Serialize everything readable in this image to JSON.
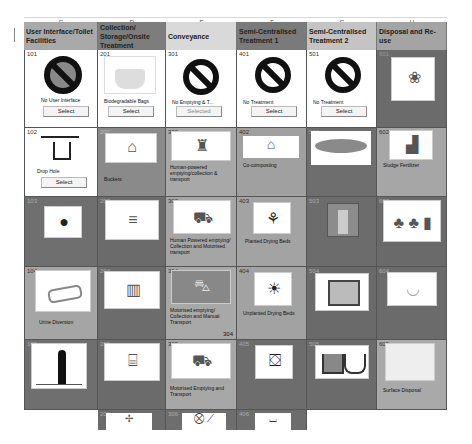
{
  "column_letters": [
    "C",
    "D",
    "E",
    "F",
    "G",
    "H"
  ],
  "headers": [
    {
      "label": "User Interface/Toilet Facilities",
      "color": "#a9a9a9"
    },
    {
      "label": "Collection/ Storage/Onsite Treatment",
      "color": "#7d7d7d"
    },
    {
      "label": "Conveyance",
      "color": "#d9d9d9"
    },
    {
      "label": "Semi-Centralised Treatment 1",
      "color": "#7a7a7a"
    },
    {
      "label": "Semi-Centralised Treatment 2",
      "color": "#c4c4c4"
    },
    {
      "label": "Disposal and Re-use",
      "color": "#a4a4a4"
    }
  ],
  "select_label": "Select",
  "selected_label": "Selected",
  "cells": {
    "c101": {
      "num": "101",
      "label": "No User Interface",
      "icon": "no-toilet-icon"
    },
    "c201": {
      "num": "201",
      "label": "Biodegradable Bags",
      "icon": "bag-icon"
    },
    "c301": {
      "num": "301",
      "label": "No Emptying & T...",
      "icon": "prohibited-icon"
    },
    "c401": {
      "num": "401",
      "label": "No Treatment",
      "icon": "prohibited-icon"
    },
    "c501": {
      "num": "501",
      "label": "No Treatment",
      "icon": "prohibited-icon"
    },
    "c601": {
      "num": "601",
      "label": "",
      "icon": "watering-can-icon"
    },
    "c102": {
      "num": "102",
      "label": "Drop Hole",
      "icon": "drop-hole-icon"
    },
    "c202": {
      "num": "202",
      "label": "Buckets",
      "icon": "bucket-icon"
    },
    "c302": {
      "num": "302",
      "label": "Human-powered emptying/collection & transport",
      "icon": "human-emptying-icon"
    },
    "c402": {
      "num": "402",
      "label": "Co-composting",
      "icon": "composting-icon"
    },
    "c502": {
      "num": "502",
      "label": "",
      "icon": "pond-icon"
    },
    "c602": {
      "num": "602",
      "label": "Sludge Fertilizer",
      "icon": "fertilizer-icon"
    },
    "c103": {
      "num": "103",
      "label": "",
      "icon": "squat-icon"
    },
    "c203": {
      "num": "203",
      "label": "",
      "icon": "trench-icon"
    },
    "c303": {
      "num": "303",
      "label": "Human Powered emptying/ Collection and Motorised transport",
      "icon": "truck-icon"
    },
    "c403": {
      "num": "403",
      "label": "Planted Drying Beds",
      "icon": "planted-bed-icon"
    },
    "c503": {
      "num": "503",
      "label": "",
      "icon": "reactor-icon"
    },
    "c603": {
      "num": "603",
      "label": "",
      "icon": "plants-icon"
    },
    "c104": {
      "num": "104",
      "label": "Urine Diversion",
      "icon": "urine-diversion-icon"
    },
    "c204": {
      "num": "204",
      "label": "",
      "icon": "tank-icon"
    },
    "c304": {
      "num": "304",
      "label": "Motorised emptying/ Collection and Manual Transport",
      "icon": "vehicle-icon",
      "corner": "304"
    },
    "c404": {
      "num": "404",
      "label": "Unplanted Drying Beds",
      "icon": "unplanted-bed-icon"
    },
    "c504": {
      "num": "504",
      "label": "",
      "icon": "filter-icon"
    },
    "c604": {
      "num": "604",
      "label": "",
      "icon": "infiltration-icon"
    },
    "c105": {
      "num": "105",
      "label": "",
      "icon": "urinal-icon"
    },
    "c205": {
      "num": "205",
      "label": "",
      "icon": "chamber-icon"
    },
    "c305": {
      "num": "305",
      "label": "Motorised Emptying and Transport",
      "icon": "pump-truck-icon"
    },
    "c405": {
      "num": "405",
      "label": "",
      "icon": "drying-icon"
    },
    "c505": {
      "num": "505",
      "label": "",
      "icon": "settler-icon"
    },
    "c605": {
      "num": "605",
      "label": "Surface Disposal",
      "icon": "surface-icon"
    },
    "c206": {
      "num": "206",
      "label": "",
      "icon": "plant-icon"
    },
    "c306": {
      "num": "306",
      "label": "",
      "icon": "transfer-icon"
    },
    "c406": {
      "num": "406",
      "label": "",
      "icon": "bed-icon"
    }
  }
}
